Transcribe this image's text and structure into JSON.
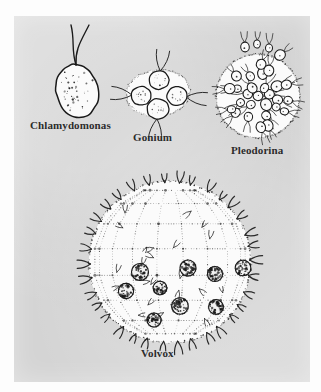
{
  "figure": {
    "background_color": "#d4d4d4",
    "page_color": "#fdfdfd",
    "ink_color": "#1a1a1a",
    "colony_fill": "#fbfbfb"
  },
  "organisms": [
    {
      "id": "chlamydomonas",
      "label": "Chlamydomonas",
      "form": "single-cell",
      "cell_count": 1,
      "flagella_per_cell": 2,
      "body": {
        "cx": 77,
        "cy": 91,
        "rx": 21,
        "ry": 27,
        "rotate": -14
      },
      "speckles": 44,
      "label_pos": {
        "x": 30,
        "y": 119
      }
    },
    {
      "id": "gonium",
      "label": "Gonium",
      "form": "flat-plate-colony",
      "cell_count": 4,
      "flagella_per_cell": 2,
      "envelope": {
        "cx": 158,
        "cy": 93,
        "rx": 32,
        "ry": 23,
        "rotate": -6
      },
      "cells": [
        {
          "cx": 159,
          "cy": 80,
          "r": 10,
          "angle": -82
        },
        {
          "cx": 141,
          "cy": 96,
          "r": 10,
          "angle": 186
        },
        {
          "cx": 177,
          "cy": 96,
          "r": 10,
          "angle": 6
        },
        {
          "cx": 158,
          "cy": 109,
          "r": 11,
          "angle": 96
        }
      ],
      "label_pos": {
        "x": 133,
        "y": 131
      }
    },
    {
      "id": "pleodorina",
      "label": "Pleodorina",
      "form": "spherical-colony",
      "cell_count": 31,
      "flagella_per_cell": 2,
      "envelope": {
        "cx": 258,
        "cy": 96,
        "r": 42
      },
      "cell_radius": [
        4.0,
        6.2
      ],
      "label_pos": {
        "x": 231,
        "y": 144
      }
    },
    {
      "id": "volvox",
      "label": "Volvox",
      "form": "spherical-colony-with-daughters",
      "cell_count": 190,
      "flagella_per_cell": 2,
      "envelope": {
        "cx": 170,
        "cy": 262,
        "r": 82
      },
      "daughter_colonies": [
        {
          "cx": 140,
          "cy": 272,
          "r": 8.5
        },
        {
          "cx": 188,
          "cy": 268,
          "r": 8.0
        },
        {
          "cx": 215,
          "cy": 274,
          "r": 7.5
        },
        {
          "cx": 243,
          "cy": 268,
          "r": 7.8
        },
        {
          "cx": 126,
          "cy": 291,
          "r": 7.6
        },
        {
          "cx": 160,
          "cy": 288,
          "r": 6.8
        },
        {
          "cx": 180,
          "cy": 306,
          "r": 8.2
        },
        {
          "cx": 216,
          "cy": 307,
          "r": 7.4
        },
        {
          "cx": 154,
          "cy": 320,
          "r": 7.0
        }
      ],
      "surface_mesh": true,
      "label_pos": {
        "x": 141,
        "y": 347
      }
    }
  ]
}
